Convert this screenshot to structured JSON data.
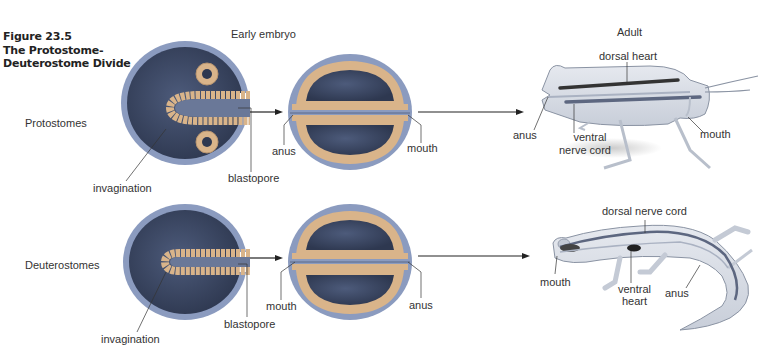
{
  "figure": {
    "number": "Figure 23.5",
    "title_line1": "The Protostome-",
    "title_line2": "Deuterostome Divide"
  },
  "headers": {
    "early_embryo": "Early embryo",
    "adult": "Adult"
  },
  "rows": {
    "protostomes": {
      "label": "Protostomes",
      "gastrula_labels": {
        "invagination": "invagination",
        "blastopore": "blastopore"
      },
      "embryo_labels": {
        "left": "anus",
        "right": "mouth"
      },
      "adult_labels": {
        "dorsal": "dorsal heart",
        "posterior": "anus",
        "ventral_line1": "ventral",
        "ventral_line2": "nerve cord",
        "anterior": "mouth"
      },
      "adult_organism": "grasshopper"
    },
    "deuterostomes": {
      "label": "Deuterostomes",
      "gastrula_labels": {
        "invagination": "invagination",
        "blastopore": "blastopore"
      },
      "embryo_labels": {
        "left": "mouth",
        "right": "anus"
      },
      "adult_labels": {
        "dorsal": "dorsal nerve cord",
        "anterior": "mouth",
        "ventral_line1": "ventral",
        "ventral_line2": "heart",
        "posterior": "anus"
      },
      "adult_organism": "salamander"
    }
  },
  "colors": {
    "endoderm_dark": "#3d4a66",
    "ectoderm": "#7f8fb5",
    "mesoderm": "#d9b48a",
    "body_light": "#d8dde6",
    "line": "#333333"
  }
}
